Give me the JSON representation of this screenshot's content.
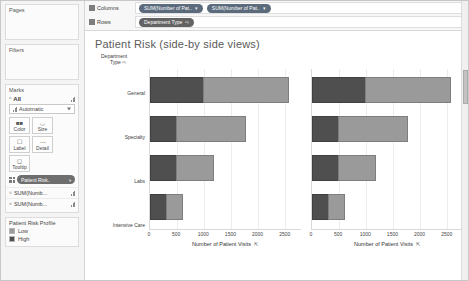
{
  "sidebar": {
    "pages": {
      "title": "Pages"
    },
    "filters": {
      "title": "Filters"
    },
    "marks": {
      "title": "Marks",
      "all_label": "All",
      "mark_type": "Automatic",
      "buttons": [
        {
          "label": "Color",
          "icon": "color-icon"
        },
        {
          "label": "Size",
          "icon": "size-icon"
        },
        {
          "label": "Label",
          "icon": "label-icon"
        },
        {
          "label": "Detail",
          "icon": "detail-icon"
        },
        {
          "label": "Tooltip",
          "icon": "tooltip-icon"
        }
      ],
      "color_pill": "Patient Risk..",
      "shelves": [
        {
          "label": "SUM(Numb..."
        },
        {
          "label": "SUM(Numb..."
        }
      ]
    },
    "legend": {
      "title": "Patient Risk Profile",
      "items": [
        {
          "label": "Low",
          "color": "#9a9a9a"
        },
        {
          "label": "High",
          "color": "#4f4f4f"
        }
      ]
    }
  },
  "shelves": {
    "columns_label": "Columns",
    "rows_label": "Rows",
    "columns_pills": [
      "SUM(Number of Pat..",
      "SUM(Number of Pat.."
    ],
    "rows_pills": [
      "Department Type"
    ]
  },
  "viz": {
    "title": "Patient Risk (side-by side views)",
    "row_header_line1": "Department",
    "row_header_line2": "Type"
  },
  "chart_data": {
    "type": "bar",
    "orientation": "horizontal",
    "stacked": true,
    "title": "Patient Risk (side-by side views)",
    "categories": [
      "General",
      "Specialty",
      "Labs",
      "Intensive Care"
    ],
    "series": [
      {
        "name": "High",
        "color": "#4f4f4f",
        "values": [
          1000,
          500,
          500,
          310
        ]
      },
      {
        "name": "Low",
        "color": "#9a9a9a",
        "values": [
          1600,
          1300,
          700,
          320
        ]
      }
    ],
    "panels": [
      {
        "xlabel": "Number of Patient Visits"
      },
      {
        "xlabel": "Number of Patient Visits"
      }
    ],
    "xticks": [
      0,
      500,
      1000,
      1500,
      2000,
      2500
    ],
    "xlim": [
      0,
      2800
    ],
    "xlabel": "Number of Patient Visits",
    "ylabel": "Department Type",
    "legend_title": "Patient Risk Profile",
    "legend_position": "left-sidebar",
    "grid": true
  }
}
